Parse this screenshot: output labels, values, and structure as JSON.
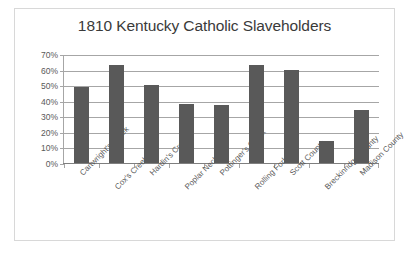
{
  "chart_data": {
    "type": "bar",
    "title": "1810 Kentucky Catholic Slaveholders",
    "xlabel": "",
    "ylabel": "",
    "categories": [
      "Cartwright's Creek",
      "Cox's Creek",
      "Hardin's Creek",
      "Poplar Neck",
      "Pottinger's Creek",
      "Rolling Fork",
      "Scott County",
      "Breckinridge County",
      "Madison County"
    ],
    "values": [
      49,
      63,
      50,
      38,
      37,
      63,
      60,
      14,
      34
    ],
    "value_unit": "%",
    "ylim": [
      0,
      70
    ],
    "ytick_labels": [
      "70%",
      "60%",
      "50%",
      "40%",
      "30%",
      "20%",
      "10%",
      "0%"
    ],
    "ytick_values": [
      70,
      60,
      50,
      40,
      30,
      20,
      10,
      0
    ],
    "grid": true,
    "legend": false,
    "bar_color": "#595959",
    "grid_color": "#a6a6a6",
    "axis_color": "#7f7f7f",
    "border_color": "#d8d8d8",
    "background": "#ffffff"
  }
}
